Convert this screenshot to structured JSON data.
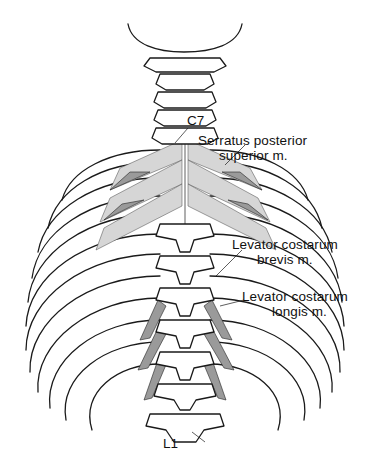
{
  "figure": {
    "labels": {
      "c7": "C7",
      "serratus": [
        "Serratus posterior",
        "superior m."
      ],
      "lev_brevis": [
        "Levator costarum",
        "brevis m."
      ],
      "lev_longis": [
        "Levator costarum",
        "longis m."
      ],
      "l1": "L1"
    }
  }
}
